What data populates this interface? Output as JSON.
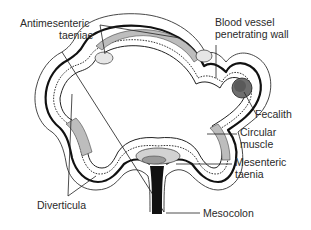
{
  "diagram": {
    "labels": {
      "antimesenteric_1": "Antimesenteric",
      "antimesenteric_2": "taeniae",
      "blood_vessel_1": "Blood vessel",
      "blood_vessel_2": "penetrating wall",
      "fecalith": "Fecalith",
      "circular_muscle_1": "Circular",
      "circular_muscle_2": "muscle",
      "mesenteric_taenia_1": "Mesenteric",
      "mesenteric_taenia_2": "taenia",
      "diverticula": "Diverticula",
      "mesocolon": "Mesocolon"
    },
    "colors": {
      "ink": "#111111",
      "label": "#2a2a2a",
      "muscle_shade": "#bdbdbd",
      "fecalith_fill": "#6e6e6e",
      "background": "#ffffff"
    }
  }
}
